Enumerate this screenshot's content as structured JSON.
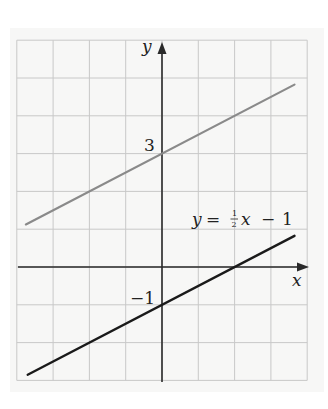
{
  "chart_data": {
    "type": "line",
    "title": "",
    "xlabel": "x",
    "ylabel": "y",
    "xlim": [
      -4,
      4
    ],
    "ylim": [
      -3,
      6
    ],
    "grid": true,
    "legend": "none",
    "y_tick_labels": [
      {
        "value": 3,
        "label": "3"
      },
      {
        "value": -1,
        "label": "−1"
      }
    ],
    "series": [
      {
        "name": "y = 1/2 x + 3",
        "equation": "y = 0.5x + 3",
        "color": "#8a8a8a",
        "x": [
          -3.75,
          0,
          3.65
        ],
        "y": [
          1.125,
          3,
          4.825
        ]
      },
      {
        "name": "y = 1/2 x - 1",
        "equation": "y = 0.5x - 1",
        "color": "#1a1a1a",
        "x": [
          -3.7,
          0,
          2,
          3.65
        ],
        "y": [
          -2.85,
          -1,
          0,
          0.825
        ]
      }
    ],
    "annotations": [
      {
        "text": "y = ½x − 1",
        "attached_to": "y = 1/2 x - 1",
        "position": [
          0.8,
          1.25
        ]
      }
    ]
  },
  "labels": {
    "x_axis": "x",
    "y_axis": "y",
    "tick_three": "3",
    "tick_neg_one": "−1",
    "eq_y": "y",
    "eq_equals": "=",
    "eq_num": "1",
    "eq_den": "2",
    "eq_x": "x",
    "eq_minus": "−",
    "eq_one": "1"
  },
  "colors": {
    "grid": "#c8c8c8",
    "axis": "#2a2a2a",
    "line_upper": "#8a8a8a",
    "line_lower": "#1a1a1a",
    "panel": "#f7f7f6"
  }
}
